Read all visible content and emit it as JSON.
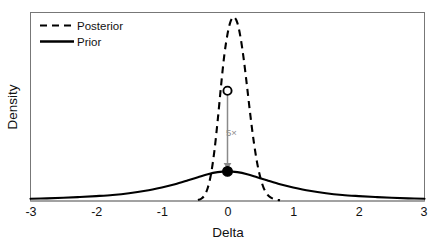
{
  "chart_data": {
    "type": "line",
    "title": "",
    "subtitle": "",
    "xlabel": "Delta",
    "ylabel": "Density",
    "xlim": [
      -3,
      3
    ],
    "ylim": [
      0,
      1.0
    ],
    "xticks": [
      "-3",
      "-2",
      "-1",
      "0",
      "1",
      "2",
      "3"
    ],
    "xtick_values": [
      -3,
      -2,
      -1,
      0,
      1,
      2,
      3
    ],
    "yticks": [],
    "grid": false,
    "legend_position": "top-left",
    "legend": [
      {
        "name": "Posterior",
        "style": "dashed"
      },
      {
        "name": "Prior",
        "style": "solid"
      }
    ],
    "series": [
      {
        "name": "Prior",
        "style": "solid",
        "color": "#000000",
        "description": "Broad heavy-tailed Cauchy-like density centred at 0",
        "x": [
          -3.0,
          -2.75,
          -2.5,
          -2.25,
          -2.0,
          -1.75,
          -1.5,
          -1.25,
          -1.0,
          -0.8,
          -0.6,
          -0.45,
          -0.3,
          -0.15,
          0.0,
          0.15,
          0.3,
          0.45,
          0.6,
          0.8,
          1.0,
          1.25,
          1.5,
          1.75,
          2.0,
          2.25,
          2.5,
          2.75,
          3.0
        ],
        "y": [
          0.012,
          0.014,
          0.017,
          0.021,
          0.026,
          0.032,
          0.041,
          0.054,
          0.072,
          0.089,
          0.11,
          0.126,
          0.142,
          0.153,
          0.157,
          0.153,
          0.142,
          0.126,
          0.11,
          0.089,
          0.072,
          0.054,
          0.041,
          0.032,
          0.026,
          0.021,
          0.017,
          0.014,
          0.012
        ]
      },
      {
        "name": "Posterior",
        "style": "dashed",
        "color": "#000000",
        "description": "Sharply peaked density centred near delta = 0.10",
        "x": [
          -0.45,
          -0.4,
          -0.35,
          -0.3,
          -0.25,
          -0.2,
          -0.15,
          -0.1,
          -0.05,
          0.0,
          0.05,
          0.1,
          0.15,
          0.2,
          0.25,
          0.3,
          0.35,
          0.4,
          0.45,
          0.5,
          0.55,
          0.6,
          0.65,
          0.72,
          0.8
        ],
        "y": [
          0.005,
          0.012,
          0.03,
          0.07,
          0.145,
          0.265,
          0.425,
          0.605,
          0.77,
          0.885,
          0.955,
          0.975,
          0.945,
          0.865,
          0.745,
          0.6,
          0.45,
          0.315,
          0.205,
          0.125,
          0.07,
          0.038,
          0.02,
          0.009,
          0.004
        ]
      }
    ],
    "annotations": [
      {
        "name": "savage-dickey-ratio",
        "label": "5×",
        "x": 0.0,
        "upper_y": 0.585,
        "lower_y": 0.157,
        "upper_marker": "open-circle",
        "lower_marker": "filled-circle",
        "arrow_direction": "down",
        "arrow_color": "#8a8a8a"
      }
    ]
  },
  "axes": {
    "xlabel": "Delta",
    "ylabel": "Density"
  },
  "legend": {
    "items": [
      {
        "label": "Posterior"
      },
      {
        "label": "Prior"
      }
    ]
  },
  "ticks": {
    "x": [
      "-3",
      "-2",
      "-1",
      "0",
      "1",
      "2",
      "3"
    ]
  },
  "annotation": {
    "ratio_label": "5×"
  },
  "colors": {
    "line": "#000000",
    "frame": "#6e6e6e",
    "annotation": "#8a8a8a",
    "background": "#ffffff"
  }
}
